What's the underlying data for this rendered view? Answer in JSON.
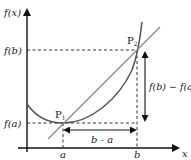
{
  "diagram": {
    "axes": {
      "y_label": "f(x)",
      "x_label": "x"
    },
    "ticks": {
      "x": [
        "a",
        "b"
      ],
      "y": [
        "f(a)",
        "f(b)"
      ]
    },
    "points": [
      {
        "name": "P",
        "sub": "1"
      },
      {
        "name": "P",
        "sub": "2"
      }
    ],
    "annotations": {
      "horizontal_span": "b - a",
      "vertical_span": "f(b) − f(a)"
    },
    "colors": {
      "axes": "#111111",
      "curve": "#555555",
      "secant": "#888888",
      "dashed": "#333333"
    }
  }
}
